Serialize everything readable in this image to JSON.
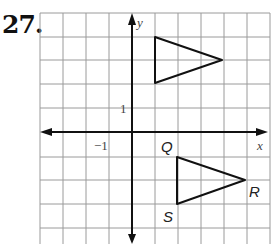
{
  "problem": {
    "number": "27."
  },
  "graph": {
    "x_axis_label": "x",
    "y_axis_label": "y",
    "tick_labels": {
      "x_neg1": "−1",
      "y_pos1": "1"
    },
    "grid": {
      "x_range": [
        -4,
        6
      ],
      "y_range": [
        -4,
        5
      ]
    }
  },
  "figures": {
    "preimage_triangle": {
      "vertices": [
        [
          1,
          4
        ],
        [
          1,
          2
        ],
        [
          4,
          3
        ]
      ]
    },
    "image_triangle": {
      "vertices": [
        {
          "label": "Q",
          "coords": [
            2,
            -1
          ]
        },
        {
          "label": "R",
          "coords": [
            5,
            -2
          ]
        },
        {
          "label": "S",
          "coords": [
            2,
            -3
          ]
        }
      ]
    }
  }
}
